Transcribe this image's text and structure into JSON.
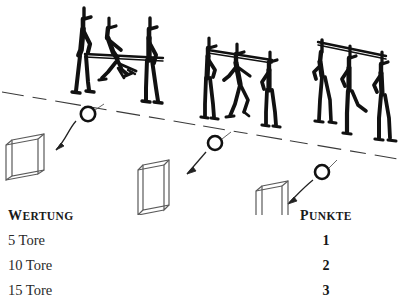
{
  "illustration": {
    "alt_title": "Stick figures behind horizontal bars kicking balls into goal frames",
    "ground_line_color": "#3a3a3a",
    "figure_ink_color": "#111111",
    "goal_frame_color": "#5a5a5a",
    "ball_color": "#111111",
    "arrow_color": "#222222",
    "groups": [
      {
        "name": "left-group",
        "figure_count": 3,
        "has_horizontal_bar": true,
        "ball_label": "ball-left",
        "goal_label": "goal-left"
      },
      {
        "name": "middle-group",
        "figure_count": 3,
        "has_horizontal_bar": true,
        "ball_label": "ball-middle",
        "goal_label": "goal-middle"
      },
      {
        "name": "right-group",
        "figure_count": 3,
        "has_horizontal_bar": true,
        "ball_label": "ball-right",
        "goal_label": "goal-right"
      }
    ]
  },
  "legend": {
    "header_left": "WERTUNG",
    "header_right": "PUNKTE",
    "rows": [
      {
        "criterion": "5 Tore",
        "points": "1"
      },
      {
        "criterion": "10 Tore",
        "points": "2"
      },
      {
        "criterion": "15 Tore",
        "points": "3"
      }
    ]
  }
}
